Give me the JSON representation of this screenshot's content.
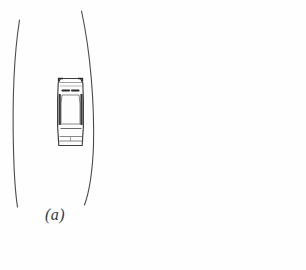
{
  "figure": {
    "caption": "(a)",
    "background_color": "#fefefe",
    "line_color": "#4a4a4a",
    "car_outline_color": "#3d3d3d",
    "car_detail_color": "#2b2b2b",
    "car_body_color": "#fdfdfd"
  },
  "lane": {
    "left_boundary": {
      "name": "left-lane-line",
      "path": "M 19.5 20 C 13.5 58, 12.5 110, 13.5 150 C 14.2 178, 15.8 196, 17.5 207",
      "stroke_width": 1.1
    },
    "right_boundary": {
      "name": "right-lane-line",
      "path": "M 81.5 11 C 90.5 52, 94.5 104, 93.5 146 C 92.3 176, 88.5 194, 84.5 205",
      "stroke_width": 1.1
    }
  },
  "car": {
    "name": "car-top-view",
    "bounds": {
      "x": 57,
      "y": 77,
      "width": 27,
      "height": 70
    },
    "body_path": "M 60.5 78.5 L 80.5 78.5 L 82.8 83 L 83.4 100 L 83.4 126 L 82.6 139 L 82.2 145.5 L 58.8 145.5 L 58.4 139 L 57.6 126 L 57.6 100 L 58.2 83 Z",
    "roof_path": "M 62 95 L 79 95 L 80 104 L 80 124 L 61 124 L 61 104 Z",
    "corner_marks": [
      {
        "name": "car-corner-front-left",
        "path": "M 58.6 81.5 L 58.6 78.6 L 63 78.6"
      },
      {
        "name": "car-corner-front-right",
        "path": "M 82.4 81.5 L 82.4 78.6 L 78 78.6"
      }
    ],
    "windshield_wipers": [
      {
        "name": "wiper-left",
        "path": "M 62.5 90.5 L 69 90.5"
      },
      {
        "name": "wiper-right",
        "path": "M 72 90.5 L 78.5 90.5"
      }
    ],
    "side_shading": [
      {
        "name": "car-left-side-shading",
        "x": 58.6,
        "y": 94,
        "width": 2.2,
        "height": 31
      },
      {
        "name": "car-right-side-shading",
        "x": 80.4,
        "y": 94,
        "width": 2.2,
        "height": 31
      }
    ],
    "rear_lines": [
      {
        "name": "rear-window-line",
        "path": "M 60.5 128.5 L 81.5 128.5"
      },
      {
        "name": "trunk-line",
        "path": "M 59.6 136.5 L 82.2 136.5"
      },
      {
        "name": "bumper-line",
        "path": "M 59.2 141 L 82.6 141"
      },
      {
        "name": "rear-center-mark",
        "path": "M 70.5 137 L 70.5 141"
      }
    ],
    "front_lines": [
      {
        "name": "hood-line",
        "path": "M 60 86 L 81.5 86"
      },
      {
        "name": "front-bumper-line",
        "path": "M 59.5 82.5 L 81.8 82.5"
      }
    ]
  }
}
